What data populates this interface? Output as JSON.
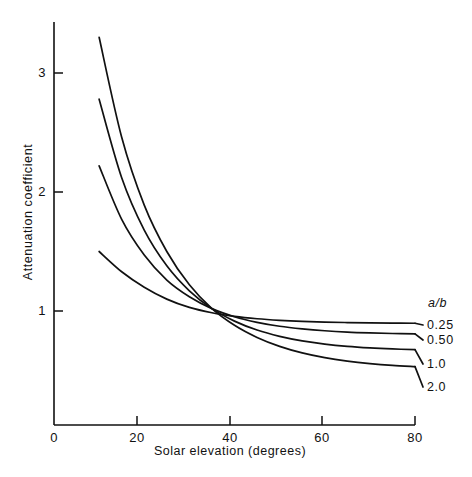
{
  "chart_data": {
    "type": "line",
    "title": "",
    "subtitle": "",
    "xlabel": "Solar elevation (degrees)",
    "ylabel": "Attenuation coefficient",
    "xlim": [
      0,
      80
    ],
    "ylim": [
      0,
      3.4
    ],
    "xticks": [
      0,
      20,
      40,
      60,
      80
    ],
    "xticklabels": [
      "0",
      "20",
      "40",
      "60",
      "80"
    ],
    "yticks": [
      1,
      2,
      3
    ],
    "yticklabels": [
      "1",
      "2",
      "3"
    ],
    "grid": false,
    "legend_title": "a/b",
    "legend_position": "right-outside",
    "annotations": [],
    "x": [
      10,
      15,
      20,
      25,
      30,
      35,
      40,
      45,
      50,
      55,
      60,
      65,
      70,
      75,
      80
    ],
    "series": [
      {
        "name": "0.25",
        "label": "0.25",
        "values": [
          1.5,
          1.33,
          1.2,
          1.1,
          1.03,
          0.985,
          0.955,
          0.935,
          0.922,
          0.913,
          0.907,
          0.903,
          0.9,
          0.898,
          0.897
        ]
      },
      {
        "name": "0.50",
        "label": "0.50",
        "values": [
          2.22,
          1.77,
          1.47,
          1.26,
          1.12,
          1.02,
          0.952,
          0.905,
          0.872,
          0.85,
          0.834,
          0.823,
          0.816,
          0.811,
          0.808
        ]
      },
      {
        "name": "1.0",
        "label": "1.0",
        "values": [
          2.78,
          2.12,
          1.68,
          1.38,
          1.17,
          1.02,
          0.915,
          0.84,
          0.787,
          0.749,
          0.722,
          0.703,
          0.69,
          0.681,
          0.675
        ]
      },
      {
        "name": "2.0",
        "label": "2.0",
        "values": [
          3.3,
          2.46,
          1.89,
          1.5,
          1.22,
          1.02,
          0.88,
          0.778,
          0.703,
          0.648,
          0.608,
          0.579,
          0.558,
          0.543,
          0.533
        ]
      }
    ]
  },
  "axes": {
    "y_tick_labels": [
      {
        "text": "3",
        "value": 3
      },
      {
        "text": "2",
        "value": 2
      },
      {
        "text": "1",
        "value": 1
      }
    ],
    "x_tick_labels": [
      {
        "text": "0",
        "value": 0
      },
      {
        "text": "20",
        "value": 20
      },
      {
        "text": "40",
        "value": 40
      },
      {
        "text": "60",
        "value": 60
      },
      {
        "text": "80",
        "value": 80
      }
    ],
    "x_axis_title": "Solar elevation (degrees)",
    "y_axis_title": "Attenuation coefficient"
  },
  "legend": {
    "title": "a/b",
    "entries": [
      {
        "label": "0.25"
      },
      {
        "label": "0.50"
      },
      {
        "label": "1.0"
      },
      {
        "label": "2.0"
      }
    ]
  },
  "style": {
    "line_color": "#111111",
    "axis_color": "#111111",
    "background": "#ffffff"
  }
}
